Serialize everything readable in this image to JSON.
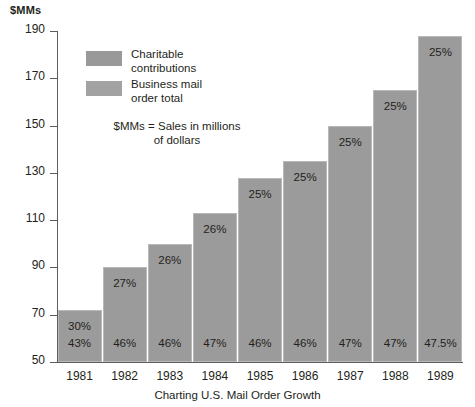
{
  "chart_data": {
    "type": "bar",
    "title": "",
    "caption": "Charting U.S. Mail Order Growth",
    "xlabel": "",
    "ylabel": "$MMs",
    "ylim": [
      50,
      190
    ],
    "yticks": [
      50,
      70,
      90,
      110,
      130,
      150,
      170,
      190
    ],
    "grid": false,
    "legend_position": "inside-upper-left",
    "categories": [
      "1981",
      "1982",
      "1983",
      "1984",
      "1985",
      "1986",
      "1987",
      "1988",
      "1989"
    ],
    "series": [
      {
        "name": "Business mail order total",
        "values": [
          72,
          90,
          100,
          113,
          128,
          135,
          150,
          165,
          188
        ]
      }
    ],
    "bar_labels_lower": [
      "43%",
      "46%",
      "46%",
      "47%",
      "46%",
      "46%",
      "47%",
      "47%",
      "47.5%"
    ],
    "bar_labels_upper": [
      "30%",
      "27%",
      "26%",
      "26%",
      "25%",
      "25%",
      "25%",
      "25%",
      "25%"
    ],
    "legend": [
      "Charitable contributions",
      "Business mail order total"
    ],
    "annotations": [
      "$MMs = Sales in millions of dollars"
    ],
    "colors": {
      "bar_fill": "#9b9b9b",
      "bar_border": "#b9b9b9",
      "axis": "#5d5d5d",
      "text": "#231f20",
      "background": "#ffffff"
    }
  },
  "legend": {
    "entries": [
      {
        "line1": "Charitable",
        "line2": "contributions"
      },
      {
        "line1": "Business mail",
        "line2": "order total"
      }
    ],
    "note_line1": "$MMs = Sales in millions",
    "note_line2": "of dollars"
  }
}
